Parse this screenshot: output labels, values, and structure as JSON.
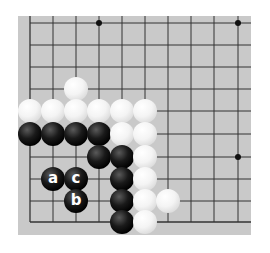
{
  "board": {
    "background": "#c9c9c9",
    "columns_x": [
      30,
      53,
      76,
      99,
      122,
      145,
      168,
      191,
      214,
      238
    ],
    "rows_y": [
      23,
      45,
      67,
      89,
      111,
      134,
      157,
      179,
      201,
      222
    ],
    "open_edges": [
      "right",
      "top-right"
    ],
    "star_points": [
      {
        "col": 3,
        "row": 0
      },
      {
        "col": 9,
        "row": 0
      },
      {
        "col": 9,
        "row": 6
      }
    ]
  },
  "stones": [
    {
      "color": "white",
      "col": 2,
      "row": 3,
      "label": ""
    },
    {
      "color": "white",
      "col": 0,
      "row": 4,
      "label": ""
    },
    {
      "color": "white",
      "col": 1,
      "row": 4,
      "label": ""
    },
    {
      "color": "white",
      "col": 2,
      "row": 4,
      "label": ""
    },
    {
      "color": "white",
      "col": 3,
      "row": 4,
      "label": ""
    },
    {
      "color": "white",
      "col": 4,
      "row": 4,
      "label": ""
    },
    {
      "color": "white",
      "col": 5,
      "row": 4,
      "label": ""
    },
    {
      "color": "black",
      "col": 0,
      "row": 5,
      "label": ""
    },
    {
      "color": "black",
      "col": 1,
      "row": 5,
      "label": ""
    },
    {
      "color": "black",
      "col": 2,
      "row": 5,
      "label": ""
    },
    {
      "color": "black",
      "col": 3,
      "row": 5,
      "label": ""
    },
    {
      "color": "white",
      "col": 4,
      "row": 5,
      "label": ""
    },
    {
      "color": "white",
      "col": 5,
      "row": 5,
      "label": ""
    },
    {
      "color": "black",
      "col": 3,
      "row": 6,
      "label": ""
    },
    {
      "color": "black",
      "col": 4,
      "row": 6,
      "label": ""
    },
    {
      "color": "white",
      "col": 5,
      "row": 6,
      "label": ""
    },
    {
      "color": "black",
      "col": 1,
      "row": 7,
      "label": "a"
    },
    {
      "color": "black",
      "col": 2,
      "row": 7,
      "label": "c"
    },
    {
      "color": "black",
      "col": 4,
      "row": 7,
      "label": ""
    },
    {
      "color": "white",
      "col": 5,
      "row": 7,
      "label": ""
    },
    {
      "color": "black",
      "col": 2,
      "row": 8,
      "label": "b"
    },
    {
      "color": "black",
      "col": 4,
      "row": 8,
      "label": ""
    },
    {
      "color": "white",
      "col": 5,
      "row": 8,
      "label": ""
    },
    {
      "color": "white",
      "col": 6,
      "row": 8,
      "label": ""
    },
    {
      "color": "black",
      "col": 4,
      "row": 9,
      "label": ""
    },
    {
      "color": "white",
      "col": 5,
      "row": 9,
      "label": ""
    }
  ]
}
